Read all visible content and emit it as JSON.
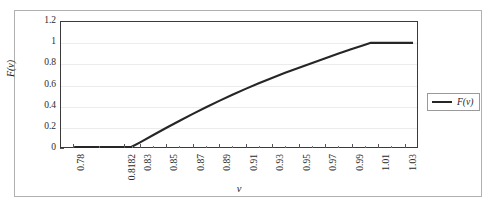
{
  "figure": {
    "background_color": "#ffffff",
    "border_color": "#b0b0b0",
    "plot_border_color": "#3a3a3a",
    "gridline_color": "#ececec",
    "series_color": "#262626"
  },
  "chart_data": {
    "type": "line",
    "title": "",
    "subtitle": "",
    "xlabel": "v",
    "ylabel": "F(v)",
    "xlim": [
      0.77,
      1.04
    ],
    "ylim": [
      0,
      1.2
    ],
    "grid": "horizontal",
    "legend_position": "right",
    "x_tick_labels": [
      "0.78",
      "0.8182",
      "0.83",
      "0.85",
      "0.87",
      "0.89",
      "0.91",
      "0.93",
      "0.95",
      "0.97",
      "0.99",
      "1.01",
      "1.03"
    ],
    "x_tick_values": [
      0.78,
      0.8182,
      0.83,
      0.85,
      0.87,
      0.89,
      0.91,
      0.93,
      0.95,
      0.97,
      0.99,
      1.01,
      1.03
    ],
    "y_tick_labels": [
      "0",
      "0.2",
      "0.4",
      "0.6",
      "0.8",
      "1",
      "1.2"
    ],
    "y_tick_values": [
      0,
      0.2,
      0.4,
      0.6,
      0.8,
      1,
      1.2
    ],
    "series": [
      {
        "name": "F(v)",
        "color": "#262626",
        "x": [
          0.78,
          0.7933,
          0.8067,
          0.8182,
          0.8233,
          0.83,
          0.84,
          0.85,
          0.86,
          0.87,
          0.88,
          0.89,
          0.9,
          0.91,
          0.92,
          0.93,
          0.94,
          0.95,
          0.96,
          0.97,
          0.98,
          0.99,
          1.0,
          1.005,
          1.01,
          1.02,
          1.03,
          1.037
        ],
        "y": [
          0.0,
          0.0,
          0.0,
          0.0,
          0.0,
          0.045,
          0.115,
          0.185,
          0.252,
          0.318,
          0.382,
          0.443,
          0.502,
          0.558,
          0.612,
          0.663,
          0.712,
          0.759,
          0.805,
          0.85,
          0.895,
          0.938,
          0.98,
          1.0,
          1.0,
          1.0,
          1.0,
          1.0
        ]
      }
    ],
    "annotations": []
  },
  "legend": {
    "entries": [
      {
        "label": "F(v)",
        "marker": "line-swatch"
      }
    ]
  },
  "axes": {
    "x_axis_name": "v-axis",
    "y_axis_name": "F(v)-axis"
  }
}
